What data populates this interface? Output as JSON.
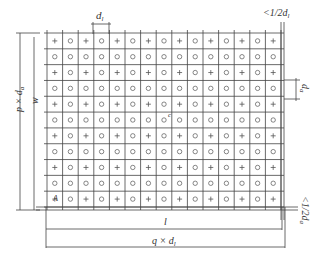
{
  "diagram": {
    "grid": {
      "rows": 11,
      "cols": 15,
      "pattern_row_odd": "alternating",
      "pattern_row_even": "all-circle",
      "symbols": {
        "plus": "+",
        "circle": "o"
      }
    },
    "labels": {
      "top_spacing": "d",
      "top_spacing_sub": "l",
      "top_right_edge": "<1/2d",
      "top_right_edge_sub": "l",
      "right_spacing": "d",
      "right_spacing_sub": "a",
      "right_bottom_edge": "<1/2d",
      "right_bottom_edge_sub": "a",
      "left_outer": "p × d",
      "left_outer_sub": "a",
      "left_inner": "w",
      "center_mark": "c",
      "corner_mark": "A",
      "bottom_inner": "l",
      "bottom_outer": "q × d",
      "bottom_outer_sub": "l"
    },
    "colors": {
      "line": "#444444",
      "symbol": "#555555",
      "text": "#333333"
    }
  }
}
